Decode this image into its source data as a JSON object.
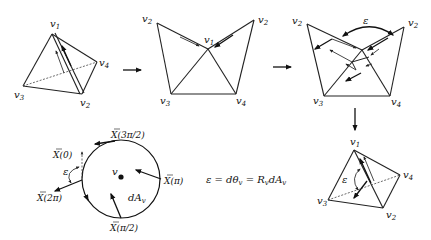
{
  "diagram": {
    "panels": [
      {
        "id": "tetrahedron",
        "vertices": [
          {
            "name": "v",
            "sub": "1"
          },
          {
            "name": "v",
            "sub": "4"
          },
          {
            "name": "v",
            "sub": "3"
          },
          {
            "name": "v",
            "sub": "2"
          }
        ]
      },
      {
        "id": "unfolded",
        "vertices": [
          {
            "name": "v",
            "sub": "2"
          },
          {
            "name": "v",
            "sub": "2"
          },
          {
            "name": "v",
            "sub": "1"
          },
          {
            "name": "v",
            "sub": "3"
          },
          {
            "name": "v",
            "sub": "4"
          }
        ]
      },
      {
        "id": "unfolded-transport",
        "vertices": [
          {
            "name": "v",
            "sub": "2"
          },
          {
            "name": "v",
            "sub": "2"
          },
          {
            "name": "v",
            "sub": "3"
          },
          {
            "name": "v",
            "sub": "4"
          }
        ],
        "angle_label": "ε"
      },
      {
        "id": "tetrahedron-result",
        "vertices": [
          {
            "name": "v",
            "sub": "1"
          },
          {
            "name": "v",
            "sub": "4"
          },
          {
            "name": "v",
            "sub": "3"
          },
          {
            "name": "v",
            "sub": "2"
          }
        ],
        "angle_label": "ε"
      },
      {
        "id": "circle-loop",
        "center_label": "v",
        "area_label": "dA",
        "area_sub": "v",
        "angle_label": "ε",
        "vectors": [
          {
            "label": "X(0)"
          },
          {
            "label": "X(3π/2)"
          },
          {
            "label": "X(π)"
          },
          {
            "label": "X(π/2)"
          },
          {
            "label": "X(2π)"
          }
        ]
      }
    ],
    "equation": {
      "lhs": "ε = dθ",
      "lhs_sub": "v",
      "mid": " = R",
      "mid_sub": "v",
      "rhs": "dA",
      "rhs_sub": "v"
    },
    "arrows": [
      "→",
      "→",
      "↓"
    ]
  }
}
